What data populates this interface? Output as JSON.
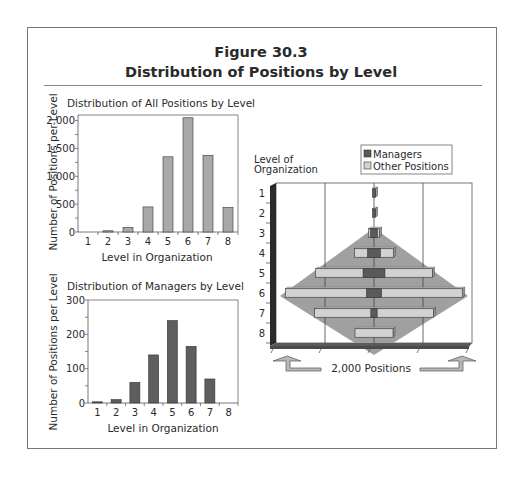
{
  "figure": {
    "title_line1": "Figure 30.3",
    "title_line2": "Distribution of Positions by Level"
  },
  "chart_data": [
    {
      "type": "bar",
      "title": "Distribution of All Positions by Level",
      "xlabel": "Level in Organization",
      "ylabel": "Number of Positions per Level",
      "categories": [
        "1",
        "2",
        "3",
        "4",
        "5",
        "6",
        "7",
        "8"
      ],
      "values": [
        0,
        10,
        80,
        450,
        1350,
        2050,
        1375,
        440
      ],
      "ylim": [
        0,
        2100
      ],
      "yticks": [
        0,
        500,
        1000,
        1500,
        2000
      ],
      "ytick_labels": [
        "0",
        "500",
        "1,000",
        "1,500",
        "2,000"
      ],
      "bar_color": "#a8a8a8",
      "grid": false
    },
    {
      "type": "bar",
      "title": "Distribution of Managers by Level",
      "xlabel": "Level in Organization",
      "ylabel": "Number of Positions per Level",
      "categories": [
        "1",
        "2",
        "3",
        "4",
        "5",
        "6",
        "7",
        "8"
      ],
      "values": [
        2,
        10,
        60,
        140,
        240,
        165,
        70,
        0
      ],
      "ylim": [
        0,
        300
      ],
      "yticks": [
        0,
        100,
        200,
        300
      ],
      "ytick_labels": [
        "0",
        "100",
        "200",
        "300"
      ],
      "bar_color": "#5e5e5e",
      "grid": false
    },
    {
      "type": "bar",
      "orientation": "horizontal-pyramid",
      "title": "",
      "ylabel": "Level of Organization",
      "xlabel": "2,000 Positions",
      "categories": [
        "1",
        "2",
        "3",
        "4",
        "5",
        "6",
        "7",
        "8"
      ],
      "series": [
        {
          "name": "Managers",
          "values": [
            2,
            10,
            60,
            140,
            240,
            165,
            70,
            0
          ],
          "color": "#5a5a5a"
        },
        {
          "name": "Other Positions",
          "values": [
            0,
            0,
            20,
            310,
            1110,
            1885,
            1305,
            440
          ],
          "color": "#d2d2d2"
        }
      ],
      "legend": {
        "position": "top-right",
        "entries": [
          "Managers",
          "Other Positions"
        ]
      },
      "background_shape": "diamond",
      "background_color": "#a0a0a0",
      "grid": true
    }
  ]
}
